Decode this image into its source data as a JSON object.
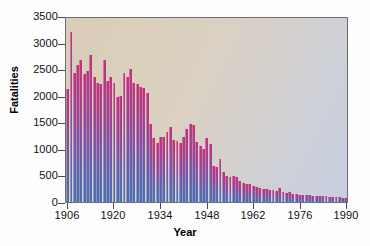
{
  "chart_data": {
    "type": "bar",
    "title": "",
    "xlabel": "Year",
    "ylabel": "Fatalities",
    "xlim": [
      1906,
      1990
    ],
    "ylim": [
      0,
      3500
    ],
    "grid": false,
    "legend": null,
    "ytick_labels": [
      "3500",
      "3000",
      "2500",
      "2000",
      "1500",
      "1000",
      "500",
      "0"
    ],
    "ytick_values": [
      3500,
      3000,
      2500,
      2000,
      1500,
      1000,
      500,
      0
    ],
    "xtick_labels": [
      "1906",
      "1920",
      "1934",
      "1948",
      "1962",
      "1976",
      "1990"
    ],
    "xtick_values": [
      1906,
      1920,
      1934,
      1948,
      1962,
      1976,
      1990
    ],
    "categories": [
      1906,
      1907,
      1908,
      1909,
      1910,
      1911,
      1912,
      1913,
      1914,
      1915,
      1916,
      1917,
      1918,
      1919,
      1920,
      1921,
      1922,
      1923,
      1924,
      1925,
      1926,
      1927,
      1928,
      1929,
      1930,
      1931,
      1932,
      1933,
      1934,
      1935,
      1936,
      1937,
      1938,
      1939,
      1940,
      1941,
      1942,
      1943,
      1944,
      1945,
      1946,
      1947,
      1948,
      1949,
      1950,
      1951,
      1952,
      1953,
      1954,
      1955,
      1956,
      1957,
      1958,
      1959,
      1960,
      1961,
      1962,
      1963,
      1964,
      1965,
      1966,
      1967,
      1968,
      1969,
      1970,
      1971,
      1972,
      1973,
      1974,
      1975,
      1976,
      1977,
      1978,
      1979,
      1980,
      1981,
      1982,
      1983,
      1984,
      1985,
      1986,
      1987,
      1988,
      1989,
      1990
    ],
    "values": [
      2150,
      3240,
      2450,
      2600,
      2700,
      2440,
      2500,
      2800,
      2380,
      2270,
      2240,
      2710,
      2310,
      2380,
      2270,
      1990,
      2020,
      2450,
      2380,
      2530,
      2270,
      2240,
      2180,
      2170,
      2080,
      1490,
      1210,
      1120,
      1230,
      1240,
      1340,
      1430,
      1180,
      1160,
      1120,
      1230,
      1390,
      1480,
      1470,
      1150,
      1060,
      1000,
      1210,
      1100,
      680,
      660,
      820,
      570,
      490,
      470,
      500,
      480,
      400,
      370,
      340,
      350,
      300,
      280,
      260,
      250,
      240,
      230,
      220,
      210,
      260,
      200,
      180,
      190,
      160,
      150,
      140,
      140,
      130,
      130,
      120,
      120,
      110,
      110,
      110,
      100,
      100,
      90,
      90,
      80,
      70
    ]
  },
  "axis_titles": {
    "x": "Year",
    "y": "Fatalities"
  }
}
